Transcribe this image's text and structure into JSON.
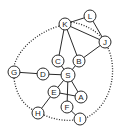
{
  "diagram": {
    "type": "graph",
    "nodes": [
      {
        "id": "K",
        "label": "K",
        "x": 65,
        "y": 24,
        "r": 6
      },
      {
        "id": "L",
        "label": "L",
        "x": 90,
        "y": 16,
        "r": 6
      },
      {
        "id": "J",
        "label": "J",
        "x": 105,
        "y": 42,
        "r": 6
      },
      {
        "id": "C",
        "label": "C",
        "x": 58,
        "y": 61,
        "r": 6
      },
      {
        "id": "B",
        "label": "B",
        "x": 79,
        "y": 61,
        "r": 6
      },
      {
        "id": "G",
        "label": "G",
        "x": 14,
        "y": 72,
        "r": 6
      },
      {
        "id": "D",
        "label": "D",
        "x": 43,
        "y": 74,
        "r": 6
      },
      {
        "id": "S",
        "label": "S",
        "x": 68,
        "y": 75,
        "r": 7
      },
      {
        "id": "E",
        "label": "E",
        "x": 54,
        "y": 92,
        "r": 6
      },
      {
        "id": "A",
        "label": "A",
        "x": 81,
        "y": 97,
        "r": 6
      },
      {
        "id": "F",
        "label": "F",
        "x": 67,
        "y": 107,
        "r": 6
      },
      {
        "id": "H",
        "label": "H",
        "x": 38,
        "y": 113,
        "r": 6
      },
      {
        "id": "I",
        "label": "I",
        "x": 80,
        "y": 119,
        "r": 6
      }
    ],
    "edges_solid": [
      [
        "K",
        "L"
      ],
      [
        "L",
        "J"
      ],
      [
        "K",
        "J"
      ],
      [
        "K",
        "C"
      ],
      [
        "K",
        "B"
      ],
      [
        "B",
        "J"
      ],
      [
        "C",
        "S"
      ],
      [
        "B",
        "S"
      ],
      [
        "G",
        "D"
      ],
      [
        "D",
        "S"
      ],
      [
        "S",
        "E"
      ],
      [
        "S",
        "A"
      ],
      [
        "S",
        "F"
      ],
      [
        "E",
        "A"
      ],
      [
        "E",
        "H"
      ],
      [
        "F",
        "I"
      ]
    ],
    "edges_dotted": [
      [
        "K",
        "J"
      ],
      [
        "K",
        "G"
      ],
      [
        "G",
        "H"
      ],
      [
        "H",
        "I"
      ],
      [
        "J",
        "I"
      ]
    ]
  }
}
